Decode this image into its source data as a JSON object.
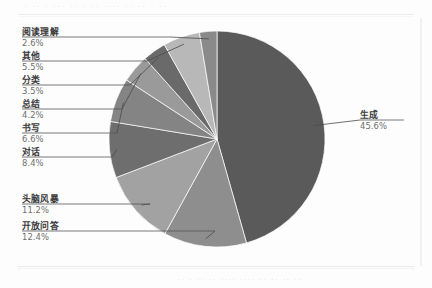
{
  "page": {
    "background_color": "#fdfdfd",
    "ghost_header": "· ·· ·  ··· ·· · ·· ···· ·· ·· · ··",
    "ghost_caption": "·· ·  ·· ··  ···· ···· ·· ·· ·· ··"
  },
  "chart_data": {
    "type": "pie",
    "title": "",
    "subtitle": "",
    "xlabel": "",
    "ylabel": "",
    "legend_position": "callout-labels",
    "grid": false,
    "start_angle_deg": 0,
    "direction": "clockwise",
    "units": "percent",
    "categories": [
      "生成",
      "开放问答",
      "头脑风暴",
      "对话",
      "书写",
      "总结",
      "分类",
      "其他",
      "阅读理解"
    ],
    "values": [
      45.6,
      12.4,
      11.2,
      8.4,
      6.6,
      4.2,
      3.5,
      5.5,
      2.6
    ],
    "value_labels": [
      "45.6%",
      "12.4%",
      "11.2%",
      "8.4%",
      "6.6%",
      "4.2%",
      "3.5%",
      "5.5%",
      "2.6%"
    ],
    "colors": [
      "#5a5a5a",
      "#8e8e8e",
      "#a2a2a2",
      "#6e6e6e",
      "#848484",
      "#9a9a9a",
      "#6a6a6a",
      "#b8b8b8",
      "#8a8a8a"
    ],
    "slices": [
      {
        "label": "生成",
        "value": 45.6,
        "value_label": "45.6%",
        "color": "#5a5a5a"
      },
      {
        "label": "开放问答",
        "value": 12.4,
        "value_label": "12.4%",
        "color": "#8e8e8e"
      },
      {
        "label": "头脑风暴",
        "value": 11.2,
        "value_label": "11.2%",
        "color": "#a2a2a2"
      },
      {
        "label": "对话",
        "value": 8.4,
        "value_label": "8.4%",
        "color": "#6e6e6e"
      },
      {
        "label": "书写",
        "value": 6.6,
        "value_label": "6.6%",
        "color": "#848484"
      },
      {
        "label": "总结",
        "value": 4.2,
        "value_label": "4.2%",
        "color": "#9a9a9a"
      },
      {
        "label": "分类",
        "value": 3.5,
        "value_label": "3.5%",
        "color": "#6a6a6a"
      },
      {
        "label": "其他",
        "value": 5.5,
        "value_label": "5.5%",
        "color": "#b8b8b8"
      },
      {
        "label": "阅读理解",
        "value": 2.6,
        "value_label": "2.6%",
        "color": "#8a8a8a"
      }
    ]
  },
  "labels": {
    "reading": {
      "name": "阅读理解",
      "value": "2.6%"
    },
    "other": {
      "name": "其他",
      "value": "5.5%"
    },
    "classify": {
      "name": "分类",
      "value": "3.5%"
    },
    "summarize": {
      "name": "总结",
      "value": "4.2%"
    },
    "write": {
      "name": "书写",
      "value": "6.6%"
    },
    "dialogue": {
      "name": "对话",
      "value": "8.4%"
    },
    "brainstorm": {
      "name": "头脑风暴",
      "value": "11.2%"
    },
    "openqa": {
      "name": "开放问答",
      "value": "12.4%"
    },
    "generate": {
      "name": "生成",
      "value": "45.6%"
    }
  },
  "style": {
    "leader_line_color": "#4a4a4a",
    "underline_color": "#555555",
    "name_text_color": "#3b3b3b",
    "value_text_color": "#6f6f6f"
  }
}
